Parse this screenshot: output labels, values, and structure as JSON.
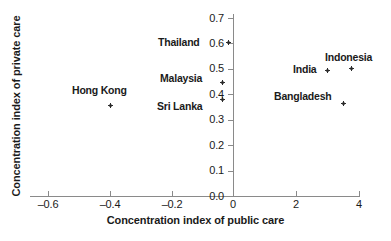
{
  "chart_data": {
    "type": "scatter",
    "title": "",
    "xlabel": "Concentration index of public care",
    "ylabel": "Concentration index of private care",
    "xlim": [
      -0.6,
      4
    ],
    "ylim": [
      0.0,
      0.7
    ],
    "grid": false,
    "legend": "none",
    "note": "X axis uses a broken / compressed scale: evenly spaced ticks at -0.6, -0.4, -0.2, 0, 2, 4",
    "xticks": [
      "–0.6",
      "–0.4",
      "–0.2",
      "0",
      "2",
      "4"
    ],
    "xtick_values": [
      -0.6,
      -0.4,
      -0.2,
      0,
      2,
      4
    ],
    "yticks": [
      "0.0",
      "0.1",
      "0.2",
      "0.3",
      "0.4",
      "0.5",
      "0.6",
      "0.7"
    ],
    "ytick_values": [
      0.0,
      0.1,
      0.2,
      0.3,
      0.4,
      0.5,
      0.6,
      0.7
    ],
    "points": [
      {
        "label": "Hong Kong",
        "x": -0.39,
        "y": 0.355,
        "px": 110,
        "py": 105,
        "lx": 72,
        "ly": 85
      },
      {
        "label": "Thailand",
        "x": -0.05,
        "y": 0.6,
        "px": 228,
        "py": 42,
        "lx": 158,
        "ly": 37
      },
      {
        "label": "Malaysia",
        "x": -0.05,
        "y": 0.435,
        "px": 222,
        "py": 82,
        "lx": 160,
        "ly": 73
      },
      {
        "label": "Sri Lanka",
        "x": -0.05,
        "y": 0.375,
        "px": 222,
        "py": 99,
        "lx": 157,
        "ly": 101
      },
      {
        "label": "India",
        "x": 2.65,
        "y": 0.478,
        "px": 327,
        "py": 70,
        "lx": 293,
        "ly": 64
      },
      {
        "label": "Indonesia",
        "x": 3.45,
        "y": 0.498,
        "px": 351,
        "py": 68,
        "lx": 325,
        "ly": 52
      },
      {
        "label": "Bangladesh",
        "x": 3.2,
        "y": 0.365,
        "px": 343,
        "py": 103,
        "lx": 274,
        "ly": 91
      }
    ],
    "colors": {
      "marker": "#2b2b2b",
      "axis": "#8a8a8a",
      "text": "#1a1a1a",
      "background": "#ffffff"
    }
  }
}
